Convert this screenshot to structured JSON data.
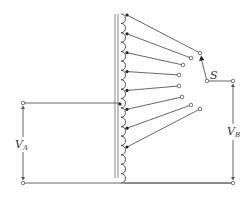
{
  "figure": {
    "labels": {
      "input_voltage": "V",
      "input_voltage_sub": "A",
      "output_voltage": "V",
      "output_voltage_sub": "B",
      "switch": "S"
    },
    "components": {
      "core": "iron-core",
      "winding": "tapped-winding",
      "tap_count": 8,
      "selected_tap": 1,
      "input_connection_tap": "between tap 5 and tap 6"
    },
    "colors": {
      "line": "#555555",
      "dot": "#222222",
      "background": "#ffffff"
    }
  }
}
